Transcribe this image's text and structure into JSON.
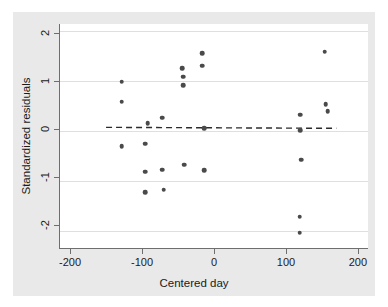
{
  "figure": {
    "background_color": "#e9e9e9",
    "plot_background_color": "#ffffff",
    "axis_color": "#6e6e6e",
    "grid_color": "#dfdfdf",
    "point_color": "#4a4a4a",
    "fit_line_color": "#2b2b2b"
  },
  "chart_data": {
    "type": "scatter",
    "title": "",
    "xlabel": "Centered day",
    "ylabel": "Standardized residuals",
    "xlim": [
      -214,
      214
    ],
    "ylim": [
      -2.48,
      2.18
    ],
    "xticks": [
      -200,
      -100,
      0,
      100,
      200
    ],
    "xtick_labels": [
      "-200",
      "-100",
      "0",
      "100",
      "200"
    ],
    "yticks": [
      2,
      1,
      0,
      -1,
      -2
    ],
    "ytick_labels": [
      "2",
      "1",
      "0",
      "-1",
      "-2"
    ],
    "grid": "horizontal",
    "legend": "none",
    "points": [
      {
        "x": -128,
        "y": 0.98
      },
      {
        "x": -128,
        "y": 0.56
      },
      {
        "x": -128,
        "y": -0.36
      },
      {
        "x": -96,
        "y": -0.31
      },
      {
        "x": -96,
        "y": -0.89
      },
      {
        "x": -96,
        "y": -1.32
      },
      {
        "x": -92,
        "y": 0.12
      },
      {
        "x": -72,
        "y": 0.23
      },
      {
        "x": -72,
        "y": -0.85
      },
      {
        "x": -70,
        "y": -1.27
      },
      {
        "x": -44,
        "y": 1.26
      },
      {
        "x": -43,
        "y": 1.08
      },
      {
        "x": -43,
        "y": 0.91
      },
      {
        "x": -41,
        "y": -0.75
      },
      {
        "x": -16,
        "y": 1.57
      },
      {
        "x": -16,
        "y": 1.31
      },
      {
        "x": -14,
        "y": 0.01
      },
      {
        "x": -14,
        "y": -0.86
      },
      {
        "x": 120,
        "y": 0.29
      },
      {
        "x": 120,
        "y": -0.03
      },
      {
        "x": 121,
        "y": -0.64
      },
      {
        "x": 119,
        "y": -1.83
      },
      {
        "x": 119,
        "y": -2.16
      },
      {
        "x": 154,
        "y": 1.6
      },
      {
        "x": 155,
        "y": 0.51
      },
      {
        "x": 158,
        "y": 0.37
      }
    ],
    "fit_line": {
      "style": "dashed",
      "x_start": -150,
      "y_start": 0.03,
      "x_end": 170,
      "y_end": 0.01
    }
  }
}
